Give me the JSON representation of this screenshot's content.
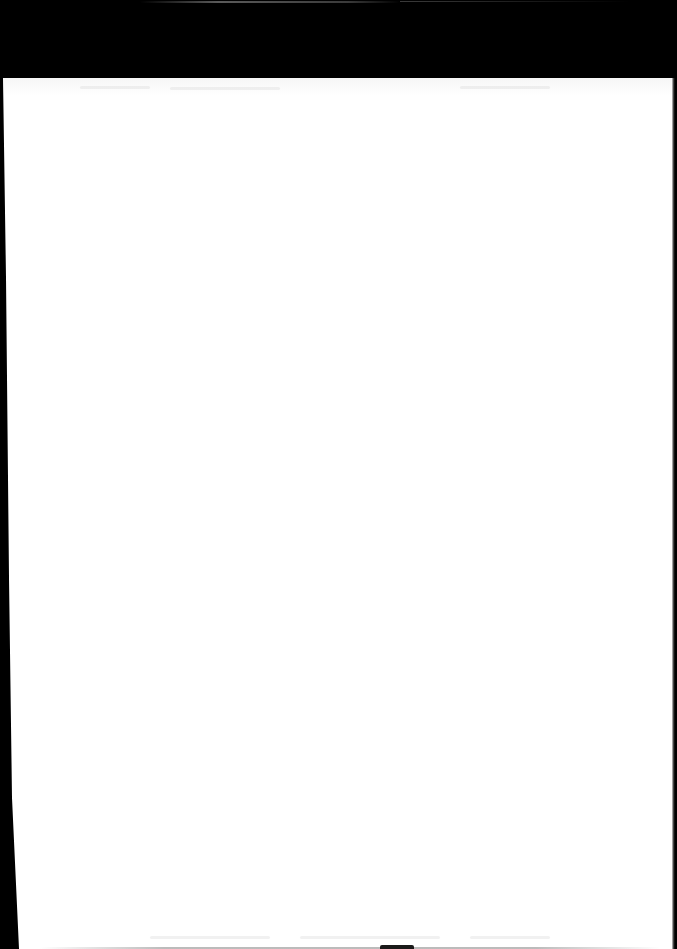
{
  "document": {
    "type": "scanned-page",
    "content_legible": false,
    "visible_text": []
  },
  "colors": {
    "border": "#000000",
    "page": "#ffffff"
  }
}
